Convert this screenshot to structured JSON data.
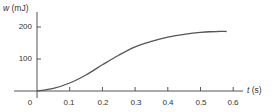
{
  "chart_data": {
    "type": "line",
    "title": "",
    "xlabel": "t (s)",
    "ylabel": "w (mJ)",
    "xlabel_var": "t",
    "xlabel_unit": "(s)",
    "ylabel_var": "w",
    "ylabel_unit": "(mJ)",
    "xlim": [
      0,
      0.65
    ],
    "ylim": [
      0,
      220
    ],
    "grid": false,
    "legend": null,
    "x_ticks": [
      "0",
      "0.1",
      "0.2",
      "0.3",
      "0.4",
      "0.5",
      "0.6"
    ],
    "y_ticks": [
      "100",
      "200"
    ],
    "series": [
      {
        "name": "w(t)",
        "color": "#555555",
        "x": [
          0,
          0.05,
          0.1,
          0.15,
          0.2,
          0.25,
          0.3,
          0.35,
          0.4,
          0.45,
          0.5,
          0.55,
          0.58
        ],
        "y": [
          0,
          8,
          25,
          50,
          82,
          112,
          138,
          155,
          168,
          177,
          183,
          186,
          186
        ]
      }
    ]
  }
}
